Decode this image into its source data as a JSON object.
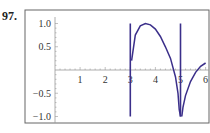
{
  "problem_number": "97.",
  "chart_data": {
    "type": "line",
    "title": "",
    "xlabel": "",
    "ylabel": "",
    "xlim": [
      0,
      6
    ],
    "ylim": [
      -1.0,
      1.0
    ],
    "x_ticks": [
      "1",
      "2",
      "3",
      "4",
      "5",
      "6"
    ],
    "y_ticks": [
      "1.0",
      "0.5",
      "-0.5",
      "-1.0"
    ],
    "grid": false,
    "series": [
      {
        "name": "curve",
        "color": "#3b2f8a",
        "x": [
          3.0,
          3.0,
          3.05,
          3.2,
          3.4,
          3.6,
          3.8,
          4.0,
          4.2,
          4.4,
          4.6,
          4.8,
          4.9,
          4.95,
          5.0,
          5.0,
          5.05,
          5.1,
          5.2,
          5.4,
          5.6,
          5.8,
          6.0
        ],
        "y": [
          1.0,
          -1.0,
          0.2,
          0.75,
          0.95,
          1.0,
          0.97,
          0.88,
          0.72,
          0.5,
          0.25,
          -0.15,
          -0.5,
          -0.85,
          -1.0,
          1.0,
          -1.0,
          -0.8,
          -0.55,
          -0.25,
          -0.05,
          0.08,
          0.15
        ]
      }
    ],
    "vertical_segments": [
      {
        "x": 3,
        "y_from": -1.0,
        "y_to": 1.0
      },
      {
        "x": 5,
        "y_from": -1.0,
        "y_to": 1.0
      }
    ]
  }
}
